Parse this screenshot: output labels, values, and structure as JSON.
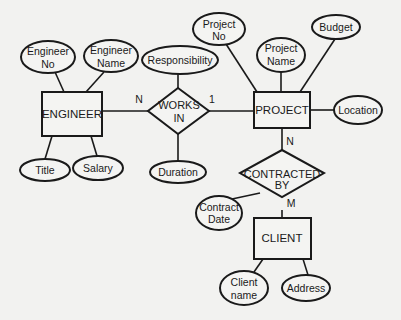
{
  "diagram": {
    "type": "entity-relationship",
    "entities": [
      {
        "id": "engineer",
        "label": "ENGINEER"
      },
      {
        "id": "project",
        "label": "PROJECT"
      },
      {
        "id": "client",
        "label": "CLIENT"
      }
    ],
    "relationships": [
      {
        "id": "works_in",
        "line1": "WORKS",
        "line2": "IN",
        "label": "WORKS IN"
      },
      {
        "id": "contracted_by",
        "line1": "CONTRACTED",
        "line2": "BY",
        "label": "CONTRACTED BY"
      }
    ],
    "attributes": {
      "engineer_no": {
        "line1": "Engineer",
        "line2": "No",
        "owner": "ENGINEER"
      },
      "engineer_name": {
        "line1": "Engineer",
        "line2": "Name",
        "owner": "ENGINEER"
      },
      "title": {
        "label": "Title",
        "owner": "ENGINEER"
      },
      "salary": {
        "label": "Salary",
        "owner": "ENGINEER"
      },
      "responsibility": {
        "label": "Responsibility",
        "owner": "WORKS IN"
      },
      "duration": {
        "label": "Duration",
        "owner": "WORKS IN"
      },
      "project_no": {
        "line1": "Project",
        "line2": "No",
        "owner": "PROJECT"
      },
      "project_name": {
        "line1": "Project",
        "line2": "Name",
        "owner": "PROJECT"
      },
      "budget": {
        "label": "Budget",
        "owner": "PROJECT"
      },
      "location": {
        "label": "Location",
        "owner": "PROJECT"
      },
      "contract_date": {
        "line1": "Contract",
        "line2": "Date",
        "owner": "CONTRACTED BY"
      },
      "client_name": {
        "line1": "Client",
        "line2": "name",
        "owner": "CLIENT"
      },
      "address": {
        "label": "Address",
        "owner": "CLIENT"
      }
    },
    "cardinalities": {
      "engineer_works_in": "N",
      "works_in_project": "1",
      "project_contracted_by": "N",
      "contracted_by_client": "M"
    }
  }
}
